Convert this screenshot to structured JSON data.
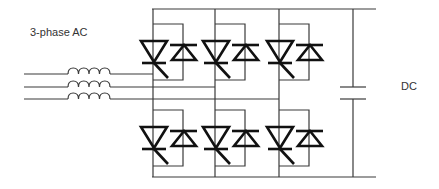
{
  "labels": {
    "ac_input": "3-phase AC",
    "dc_output": "DC"
  },
  "diagram": {
    "type": "three-phase thyristor bridge rectifier/inverter",
    "input": {
      "phases": 3,
      "component": "inductor",
      "count": 3
    },
    "switches": {
      "type": "thyristor with antiparallel diode",
      "upper_count": 3,
      "lower_count": 3
    },
    "dc_link": {
      "component": "capacitor"
    },
    "colors": {
      "wire": "#3a3a3a",
      "device": "#111111",
      "background": "#ffffff"
    }
  }
}
